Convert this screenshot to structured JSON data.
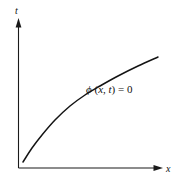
{
  "figure": {
    "background_color": "#ffffff",
    "ink_color": "#141414",
    "axes": {
      "vertical": {
        "label": "t",
        "name": "t-axis",
        "x_px": 18,
        "top_px": 20,
        "bottom_px": 168,
        "arrow": "up-arrow"
      },
      "horizontal": {
        "label": "x",
        "name": "x-axis",
        "y_px": 168,
        "left_px": 18,
        "right_px": 163,
        "arrow": "right-arrow"
      }
    },
    "curve": {
      "label_phi": "ϕ",
      "label_open": " (",
      "label_x": "x",
      "label_comma": ", ",
      "label_t": "t",
      "label_close": ") ",
      "label_equals": "= ",
      "label_zero": "0",
      "label_full": "ϕ (x, t) = 0"
    }
  },
  "chart_data": {
    "type": "line",
    "title": "",
    "xlabel": "x",
    "ylabel": "t",
    "grid": false,
    "legend": null,
    "annotations": [
      {
        "text": "ϕ (x, t) = 0",
        "x_px": 86,
        "y_px": 84,
        "describes": "curve"
      }
    ],
    "series": [
      {
        "name": "ϕ (x, t) = 0",
        "x_px": [
          23,
          32,
          42,
          55,
          70,
          85,
          100,
          118,
          138,
          158
        ],
        "y_px": [
          162,
          148,
          135,
          120,
          106,
          95,
          86,
          76,
          66,
          57
        ]
      }
    ],
    "axis_ranges_px": {
      "x": [
        18,
        163
      ],
      "y": [
        168,
        20
      ]
    }
  }
}
